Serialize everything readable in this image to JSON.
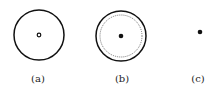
{
  "figures": [
    {
      "label": "(a)",
      "description": "solid circle with hollow center dot"
    },
    {
      "label": "(b)",
      "description": "solid circle with dotted inner circle and filled center dot"
    },
    {
      "label": "(c)",
      "description": "single filled dot"
    }
  ],
  "colors": {
    "stroke": "#111111",
    "background": "#ffffff"
  }
}
